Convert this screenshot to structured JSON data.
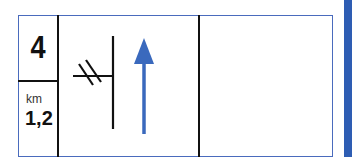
{
  "route_card": {
    "step_number": "4",
    "distance_unit": "km",
    "distance_value": "1,2",
    "instruction_icon": "straight-ahead-arrow-icon",
    "junction_icon": "side-road-junction-icon",
    "notes": ""
  },
  "colors": {
    "border": "#4a6bbd",
    "arrow": "#3a69bd",
    "lines": "#111111",
    "side_bar": "#2e5db3"
  }
}
